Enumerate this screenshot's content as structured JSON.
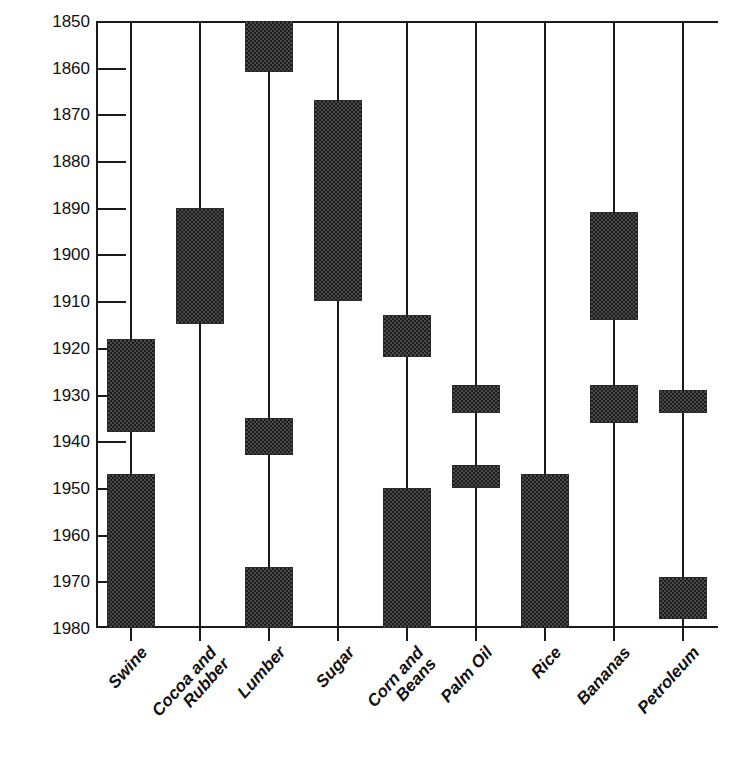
{
  "chart_data": {
    "type": "bar",
    "title": "",
    "subtitle": "",
    "xlabel": "",
    "ylabel": "",
    "orientation": "vertical",
    "grid": false,
    "legend": false,
    "y_axis": {
      "min": 1850,
      "max": 1980,
      "inverted": true,
      "tick_step": 10,
      "ticks": [
        1850,
        1860,
        1870,
        1880,
        1890,
        1900,
        1910,
        1920,
        1930,
        1940,
        1950,
        1960,
        1970,
        1980
      ],
      "tick_labels": [
        "1850",
        "1860",
        "1870",
        "1880",
        "1890",
        "1900",
        "1910",
        "1920",
        "1930",
        "1940",
        "1950",
        "1960",
        "1970",
        "1980"
      ]
    },
    "categories": [
      "Swine",
      "Cocoa and Rubber",
      "Lumber",
      "Sugar",
      "Corn and Beans",
      "Palm Oil",
      "Rice",
      "Bananas",
      "Petroleum"
    ],
    "series": [
      {
        "name": "Swine",
        "label_lines": [
          "Swine"
        ],
        "spans": [
          {
            "start": 1918,
            "end": 1938
          },
          {
            "start": 1947,
            "end": 1980
          }
        ]
      },
      {
        "name": "Cocoa and Rubber",
        "label_lines": [
          "Cocoa and",
          "Rubber"
        ],
        "spans": [
          {
            "start": 1890,
            "end": 1915
          }
        ]
      },
      {
        "name": "Lumber",
        "label_lines": [
          "Lumber"
        ],
        "spans": [
          {
            "start": 1850,
            "end": 1861
          },
          {
            "start": 1935,
            "end": 1943
          },
          {
            "start": 1967,
            "end": 1980
          }
        ]
      },
      {
        "name": "Sugar",
        "label_lines": [
          "Sugar"
        ],
        "spans": [
          {
            "start": 1867,
            "end": 1910
          }
        ]
      },
      {
        "name": "Corn and Beans",
        "label_lines": [
          "Corn and",
          "Beans"
        ],
        "spans": [
          {
            "start": 1913,
            "end": 1922
          },
          {
            "start": 1950,
            "end": 1980
          }
        ]
      },
      {
        "name": "Palm Oil",
        "label_lines": [
          "Palm Oil"
        ],
        "spans": [
          {
            "start": 1928,
            "end": 1934
          },
          {
            "start": 1945,
            "end": 1950
          }
        ]
      },
      {
        "name": "Rice",
        "label_lines": [
          "Rice"
        ],
        "spans": [
          {
            "start": 1947,
            "end": 1980
          }
        ]
      },
      {
        "name": "Bananas",
        "label_lines": [
          "Bananas"
        ],
        "spans": [
          {
            "start": 1891,
            "end": 1914
          },
          {
            "start": 1928,
            "end": 1936
          }
        ]
      },
      {
        "name": "Petroleum",
        "label_lines": [
          "Petroleum"
        ],
        "spans": [
          {
            "start": 1929,
            "end": 1934
          },
          {
            "start": 1969,
            "end": 1978
          }
        ]
      }
    ],
    "colors": {
      "bar_fill": "#4a4a4a",
      "bar_hatch": "#1c1c1c",
      "axis": "#1a1a1a",
      "background": "#ffffff",
      "text": "#111111"
    }
  }
}
